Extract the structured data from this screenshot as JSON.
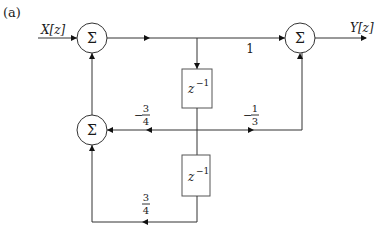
{
  "figure_label": "(a)",
  "input_label": "X[z]",
  "output_label": "Y[z]",
  "summers": [
    {
      "id": "sum-top-left",
      "symbol": "Σ"
    },
    {
      "id": "sum-top-right",
      "symbol": "Σ"
    },
    {
      "id": "sum-bottom-left",
      "symbol": "Σ"
    }
  ],
  "delays": [
    {
      "id": "delay-upper",
      "base": "z",
      "exp": "−1"
    },
    {
      "id": "delay-lower",
      "base": "z",
      "exp": "−1"
    }
  ],
  "gains": {
    "forward_direct": {
      "num": "1"
    },
    "feedback_first": {
      "sign": "−",
      "num": "3",
      "den": "4"
    },
    "feedforward_first": {
      "sign": "−",
      "num": "1",
      "den": "3"
    },
    "feedback_second": {
      "sign": "",
      "num": "3",
      "den": "4"
    }
  }
}
